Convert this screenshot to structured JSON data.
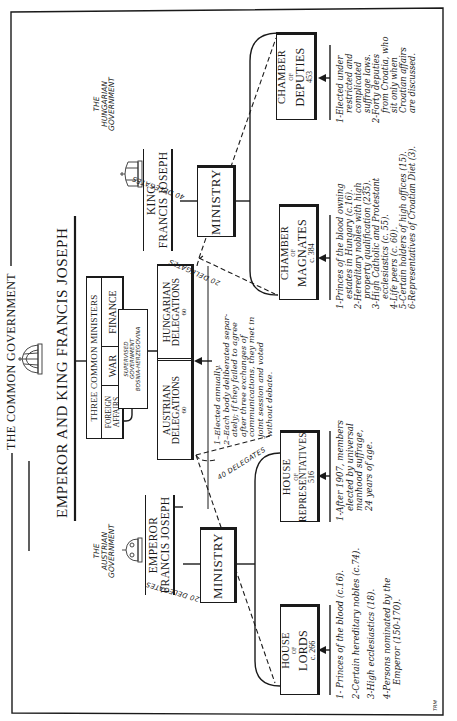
{
  "frame_title": "THE COMMON GOVERNMENT",
  "emperor_bar": "EMPEROR AND KING FRANCIS JOSEPH",
  "common_ministers": {
    "header": "THREE COMMON MINISTERS",
    "ministries": [
      "FOREIGN AFFAIRS",
      "WAR",
      "FINANCE"
    ],
    "supervised_note": [
      "SUPERVISED",
      "GOVERNMENT",
      "BOSNIA-HERZEGOVINA"
    ]
  },
  "delegations": {
    "austrian": {
      "line1": "AUSTRIAN",
      "line2": "DELEGATIONS",
      "count": "60"
    },
    "hungarian": {
      "line1": "HUNGARIAN",
      "line2": "DELEGATIONS",
      "count": "60"
    },
    "notes": [
      "1–Elected annually.",
      "2–Each body deliberated separ-",
      "ately; if they failed to agree",
      "after three exchanges of",
      "communications, they met in",
      "joint session and voted",
      "without debate."
    ]
  },
  "austrian_government": {
    "label": [
      "THE",
      "AUSTRIAN",
      "GOVERNMENT"
    ],
    "monarch": [
      "EMPEROR",
      "FRANCIS JOSEPH"
    ],
    "ministry": "MINISTRY",
    "houses": [
      {
        "id": "lords",
        "line1": "HOUSE",
        "of": "OF",
        "line2": "LORDS",
        "count": "c. 266",
        "delegates": "20 DELEGATES",
        "notes": [
          "1- Princes of the blood (c.16).",
          "2-Certain hereditary nobles (c.74).",
          "3-High ecclesiastics (18).",
          "4-Persons nominated by the",
          "Emperor (150-170)."
        ]
      },
      {
        "id": "representatives",
        "line1": "HOUSE",
        "of": "OF",
        "line2": "REPRESENTATIVES",
        "count": "516",
        "delegates": "40 DELEGATES",
        "notes": [
          "1-After 1907, members",
          "elected by universal",
          "manhood suffrage,",
          "24 years of age."
        ]
      }
    ]
  },
  "hungarian_government": {
    "label": [
      "THE",
      "HUNGARIAN",
      "GOVERNMENT"
    ],
    "monarch": [
      "KING",
      "FRANCIS JOSEPH"
    ],
    "ministry": "MINISTRY",
    "houses": [
      {
        "id": "magnates",
        "line1": "CHAMBER",
        "of": "OF",
        "line2": "MAGNATES",
        "count": "c. 384",
        "delegates": "20 DELEGATES",
        "notes": [
          "1-Princes of the blood owning",
          "estates in Hungary (c.16).",
          "2-Hereditary nobles with high",
          "property qualification (235).",
          "3-High Catholic and Protestant",
          "ecclesiastics (c. 55).",
          "4-Life peers (c. 60).",
          "5-Certain holders of high offices (15).",
          "6-Representatives of Croatian Diet (3)."
        ]
      },
      {
        "id": "deputies",
        "line1": "CHAMBER",
        "of": "OF",
        "line2": "DEPUTIES",
        "count": "453",
        "delegates": "40 DELEGATES",
        "notes": [
          "1-Elected under",
          "restricted and",
          "complicated",
          "suffrage laws.",
          "2-Forty deputies",
          "from Croatia, who",
          "sit only when",
          "Croatian affairs",
          "are discussed."
        ]
      }
    ]
  },
  "signature": "TRM"
}
